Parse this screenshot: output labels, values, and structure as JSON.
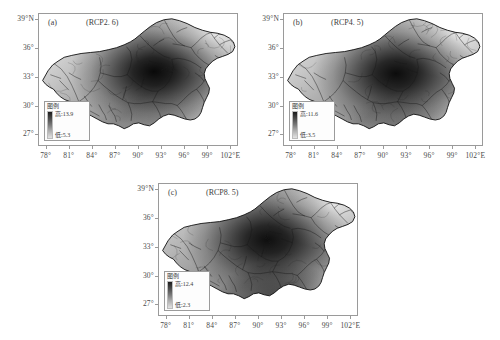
{
  "figure": {
    "type": "map-series",
    "region": "Qinghai-Tibet Plateau",
    "axis": {
      "x_ticks": [
        "78°",
        "81°",
        "84°",
        "87°",
        "90°",
        "93°",
        "96°",
        "99°",
        "102°E"
      ],
      "y_ticks": [
        "39°N",
        "36°",
        "33°",
        "30°",
        "27°"
      ],
      "x_values": [
        78,
        81,
        84,
        87,
        90,
        93,
        96,
        99,
        102
      ],
      "y_values": [
        39,
        36,
        33,
        30,
        27
      ],
      "xlim": [
        77.0,
        103.0
      ],
      "ylim": [
        25.8,
        39.6
      ]
    },
    "legend_title": "图例",
    "high_prefix": "高:",
    "low_prefix": "低:",
    "colors": {
      "ramp_high": "#1b1b1b",
      "ramp_low": "#e2e2e2",
      "frame": "#9a9a9a",
      "text": "#4a4a4a",
      "background": "#ffffff"
    }
  },
  "chart_data": {
    "type": "heatmap",
    "title": "",
    "xlabel": "",
    "ylabel": "",
    "panels": [
      {
        "id": "a",
        "label": "(a)",
        "scenario": "(RCP2. 6)",
        "legend_title": "图例",
        "high_label": "高:13.9",
        "low_label": "低:5.3",
        "high_value": 13.9,
        "low_value": 5.3,
        "hotspot": {
          "lon": 92.5,
          "lat": 33.2
        }
      },
      {
        "id": "b",
        "label": "(b)",
        "scenario": "(RCP4. 5)",
        "legend_title": "图例",
        "high_label": "高:11.6",
        "low_label": "低:3.5",
        "high_value": 11.6,
        "low_value": 3.5,
        "hotspot": {
          "lon": 92.3,
          "lat": 33.0
        }
      },
      {
        "id": "c",
        "label": "(c)",
        "scenario": "(RCP8. 5)",
        "legend_title": "图例",
        "high_label": "高:12.4",
        "low_label": "低:2.3",
        "high_value": 12.4,
        "low_value": 2.3,
        "hotspot": {
          "lon": 92.0,
          "lat": 33.4
        }
      }
    ]
  }
}
